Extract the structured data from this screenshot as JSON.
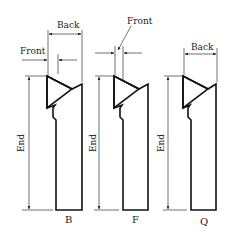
{
  "diagram": {
    "type": "technical-drawing",
    "tools": [
      {
        "id": "B",
        "caption": "B",
        "dimensions": {
          "front": "Front",
          "back": "Back",
          "end": "End"
        }
      },
      {
        "id": "F",
        "caption": "F",
        "dimensions": {
          "front": "Front",
          "end": "End"
        }
      },
      {
        "id": "Q",
        "caption": "Q",
        "dimensions": {
          "back": "Back",
          "end": "End"
        }
      }
    ]
  },
  "colors": {
    "line": "#111111",
    "background": "#ffffff"
  }
}
